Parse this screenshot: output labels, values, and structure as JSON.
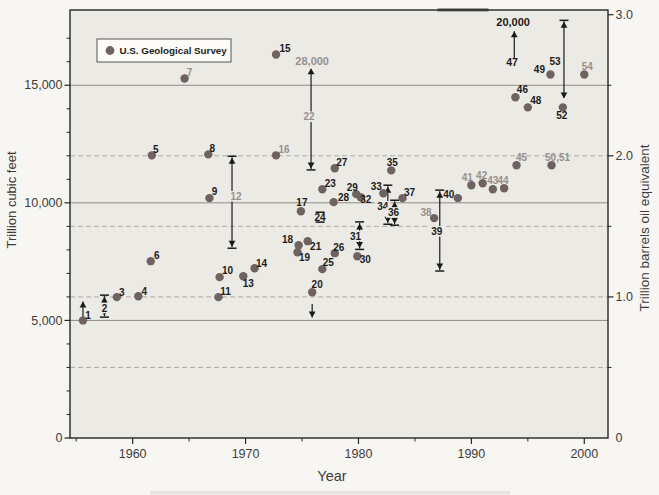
{
  "chart_data": {
    "type": "scatter",
    "title": "",
    "x_axis": {
      "label": "Year",
      "range": [
        1954.45,
        2002.1
      ],
      "major_ticks": [
        1960,
        1970,
        1980,
        1990,
        2000
      ],
      "minor_ticks": [
        1955,
        1965,
        1975,
        1985,
        1995
      ]
    },
    "y_left": {
      "label": "Trillion cubic feet",
      "range": [
        0,
        18200
      ],
      "minor_step": 1000,
      "major_ticks": [
        {
          "v": 0,
          "t": "0"
        },
        {
          "v": 5000,
          "t": "5,000"
        },
        {
          "v": 10000,
          "t": "10,000"
        },
        {
          "v": 15000,
          "t": "15,000"
        }
      ]
    },
    "y_right": {
      "label": "Trillion barrels oil equivalent",
      "tcf_per_unit": 6000,
      "major_ticks": [
        {
          "v": 0,
          "t": "0"
        },
        {
          "v": 6000,
          "t": "1.0"
        },
        {
          "v": 12000,
          "t": "2.0"
        },
        {
          "v": 18000,
          "t": "3.0"
        }
      ],
      "minor_ticks": [
        3000,
        9000,
        15000
      ]
    },
    "gridlines": {
      "solid_tcf": [
        5000,
        10000,
        15000
      ],
      "dashed_tcf": [
        3000,
        6000,
        9000,
        12000
      ]
    },
    "legend": {
      "label": "U.S. Geological Survey"
    },
    "points": [
      {
        "n": "1",
        "year": 1955.6,
        "tcf": 5000,
        "dx": 5,
        "dy": -5
      },
      {
        "n": "3",
        "year": 1958.6,
        "tcf": 5990,
        "dx": 5,
        "dy": -5
      },
      {
        "n": "4",
        "year": 1960.5,
        "tcf": 6030,
        "dx": 6,
        "dy": -5
      },
      {
        "n": "5",
        "year": 1961.7,
        "tcf": 12020,
        "dx": 4,
        "dy": -6
      },
      {
        "n": "6",
        "year": 1961.6,
        "tcf": 7520,
        "dx": 6,
        "dy": -6
      },
      {
        "n": "7",
        "year": 1964.6,
        "tcf": 15290,
        "dx": 5,
        "dy": -6,
        "gray": true
      },
      {
        "n": "8",
        "year": 1966.7,
        "tcf": 12060,
        "dx": 4,
        "dy": -6
      },
      {
        "n": "9",
        "year": 1966.8,
        "tcf": 10200,
        "dx": 5,
        "dy": -7
      },
      {
        "n": "10",
        "year": 1967.7,
        "tcf": 6840,
        "dx": 8,
        "dy": -7
      },
      {
        "n": "11",
        "year": 1967.6,
        "tcf": 5990,
        "dx": 7,
        "dy": -6
      },
      {
        "n": "13",
        "year": 1969.8,
        "tcf": 6880,
        "dx": 5,
        "dy": 7
      },
      {
        "n": "14",
        "year": 1970.8,
        "tcf": 7220,
        "dx": 7,
        "dy": -5
      },
      {
        "n": "15",
        "year": 1972.7,
        "tcf": 16310,
        "dx": 9,
        "dy": -6
      },
      {
        "n": "16",
        "year": 1972.7,
        "tcf": 12020,
        "dx": 8,
        "dy": -6,
        "gray": true
      },
      {
        "n": "17",
        "year": 1974.9,
        "tcf": 9640,
        "dx": 1,
        "dy": -9
      },
      {
        "n": "18",
        "year": 1974.7,
        "tcf": 8200,
        "dx": -11,
        "dy": -6
      },
      {
        "n": "19",
        "year": 1974.6,
        "tcf": 7900,
        "dx": 7,
        "dy": 5
      },
      {
        "n": "20",
        "year": 1975.9,
        "tcf": 6200,
        "dx": 5,
        "dy": -8
      },
      {
        "n": "21",
        "year": 1975.5,
        "tcf": 8370,
        "dx": 8,
        "dy": 5
      },
      {
        "n": "23",
        "year": 1976.8,
        "tcf": 10580,
        "dx": 8,
        "dy": -6
      },
      {
        "n": "25",
        "year": 1976.8,
        "tcf": 7180,
        "dx": 6,
        "dy": -7
      },
      {
        "n": "26",
        "year": 1977.9,
        "tcf": 7860,
        "dx": 4,
        "dy": -6
      },
      {
        "n": "27",
        "year": 1977.9,
        "tcf": 11470,
        "dx": 7,
        "dy": -6
      },
      {
        "n": "28",
        "year": 1977.8,
        "tcf": 10030,
        "dx": 10,
        "dy": -5
      },
      {
        "n": "29",
        "year": 1979.8,
        "tcf": 10370,
        "dx": -4,
        "dy": -7
      },
      {
        "n": "30",
        "year": 1979.9,
        "tcf": 7730,
        "dx": 8,
        "dy": 3
      },
      {
        "n": "32",
        "year": 1980.2,
        "tcf": 10240,
        "dx": 5,
        "dy": 2
      },
      {
        "n": "33",
        "year": 1982.2,
        "tcf": 10410,
        "dx": -7,
        "dy": -7
      },
      {
        "n": "35",
        "year": 1982.9,
        "tcf": 11380,
        "dx": 1,
        "dy": -8
      },
      {
        "n": "37",
        "year": 1983.9,
        "tcf": 10200,
        "dx": 7,
        "dy": -6
      },
      {
        "n": "38",
        "year": 1986.7,
        "tcf": 9350,
        "dx": -8,
        "dy": -6,
        "gray": true
      },
      {
        "n": "40",
        "year": 1988.8,
        "tcf": 10200,
        "dx": -9,
        "dy": -4
      },
      {
        "n": "41",
        "year": 1990.0,
        "tcf": 10750,
        "dx": -4,
        "dy": -8,
        "gray": true
      },
      {
        "n": "42",
        "year": 1991.0,
        "tcf": 10830,
        "dx": -1,
        "dy": -8,
        "gray": true
      },
      {
        "n": "43",
        "year": 1991.9,
        "tcf": 10580,
        "dx": 0,
        "dy": -9,
        "gray": true
      },
      {
        "n": "44",
        "year": 1992.9,
        "tcf": 10620,
        "dx": -1,
        "dy": -8,
        "gray": true
      },
      {
        "n": "45",
        "year": 1994.0,
        "tcf": 11600,
        "dx": 5,
        "dy": -8,
        "gray": true
      },
      {
        "n": "46",
        "year": 1993.9,
        "tcf": 14490,
        "dx": 7,
        "dy": -8
      },
      {
        "n": "48",
        "year": 1995.0,
        "tcf": 14060,
        "dx": 8,
        "dy": -7
      },
      {
        "n": "49",
        "year": 1997.0,
        "tcf": 15460,
        "dx": -11,
        "dy": -5
      },
      {
        "n": "50,51",
        "year": 1997.1,
        "tcf": 11600,
        "dx": 6,
        "dy": -8,
        "gray": true
      },
      {
        "n": "52",
        "year": 1998.1,
        "tcf": 14060,
        "dx": -1,
        "dy": 8
      },
      {
        "n": "54",
        "year": 2000.0,
        "tcf": 15460,
        "dx": 3,
        "dy": -8,
        "gray": true
      }
    ],
    "ranges": [
      {
        "n": "2",
        "year": 1957.5,
        "hi": 6075,
        "lo": 5140,
        "label_tcf": 5530,
        "dx": 0,
        "bg": true
      },
      {
        "n": "12",
        "year": 1968.8,
        "hi": 11980,
        "lo": 8070,
        "label_tcf": 10280,
        "dx": 4,
        "bg": true,
        "gray": true
      },
      {
        "n": "22",
        "year": 1975.8,
        "hi": 15720,
        "lo": 11400,
        "label_tcf": 13660,
        "dx": -2,
        "bg": true,
        "gray": true,
        "no_cap_top": true
      },
      {
        "n": "24",
        "year": 1976.6,
        "hi": 9600,
        "lo": 9180,
        "label_tcf": 9390,
        "dx": 0,
        "bars_only": true
      },
      {
        "n": "31",
        "year": 1980.1,
        "hi": 9190,
        "lo": 8020,
        "label_tcf": 8590,
        "dx": -4,
        "bg": true
      },
      {
        "n": "34",
        "year": 1982.6,
        "hi": 10750,
        "lo": 9090,
        "label_tcf": 9850,
        "dx": -5,
        "bg": true
      },
      {
        "n": "36",
        "year": 1983.2,
        "hi": 10110,
        "lo": 9050,
        "label_tcf": 9590,
        "dx": -1,
        "bg": true
      },
      {
        "n": "39",
        "year": 1987.2,
        "hi": 10540,
        "lo": 7100,
        "label_tcf": 8790,
        "dx": -3,
        "bg": true
      },
      {
        "n": "53",
        "year": 1998.2,
        "hi": 17760,
        "lo": 14440,
        "label_tcf": 16000,
        "dx": -9,
        "no_cap_bot": true
      }
    ],
    "arrows": [
      {
        "year": 1955.6,
        "from": 5150,
        "to": 5800,
        "dir": "up"
      },
      {
        "year": 1975.9,
        "from": 5700,
        "to": 5120,
        "dir": "down"
      },
      {
        "year": 1993.8,
        "from": 16150,
        "to": 17300,
        "dir": "up"
      }
    ],
    "annotations": [
      {
        "text": "28,000",
        "year": 1975.9,
        "tcf": 16000,
        "size": 11,
        "gray": true
      },
      {
        "text": "20,000",
        "year": 1993.7,
        "tcf": 17680,
        "size": 11
      },
      {
        "text": "47",
        "year": 1993.6,
        "tcf": 15980,
        "size": 10.5
      }
    ]
  },
  "colors": {
    "bg": "#f8f6f2",
    "plot_bg": "#eceae5",
    "frame": "#262626",
    "grid_solid": "#8e8b87",
    "grid_dashed": "#b0ada8",
    "dot": "#6f6361",
    "dark": "#1b1b1b",
    "gray": "#96918b",
    "axis_text": "#3c3c3c",
    "legend_bg": "#fcfbf8",
    "legend_border": "#555555"
  }
}
